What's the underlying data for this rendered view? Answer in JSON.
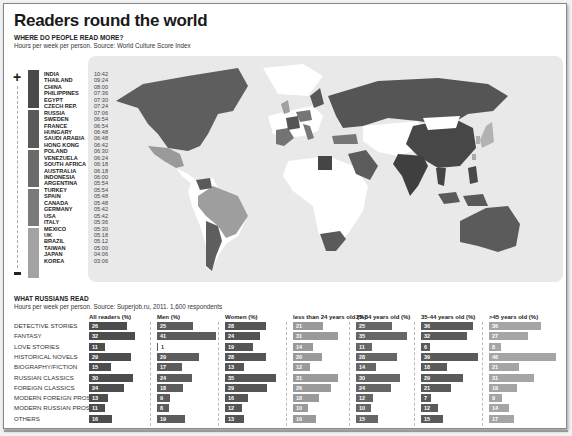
{
  "header": {
    "title": "Readers round the world",
    "map_section_title": "WHERE DO PEOPLE READ MORE?",
    "map_section_subtitle": "Hours per week per person. Source: World Culture Score Index",
    "russia_section_title": "WHAT RUSSIANS READ",
    "russia_section_subtitle": "Hours per week per person. Source: Superjob.ru, 2011. 1,600 respondents"
  },
  "legend": {
    "more_symbol": "+",
    "less_symbol": "-",
    "groups": [
      {
        "color": "#4a4a4a",
        "rows": 6
      },
      {
        "color": "#5a5a5a",
        "rows": 6
      },
      {
        "color": "#6a6a6a",
        "rows": 6
      },
      {
        "color": "#7a7a7a",
        "rows": 6
      },
      {
        "color": "#a3a3a3",
        "rows": 6
      }
    ],
    "countries": [
      {
        "name": "INDIA",
        "time": "10:42"
      },
      {
        "name": "THAILAND",
        "time": "09:24"
      },
      {
        "name": "CHINA",
        "time": "08:00"
      },
      {
        "name": "PHILIPPINES",
        "time": "07:36"
      },
      {
        "name": "EGYPT",
        "time": "07:30"
      },
      {
        "name": "CZECH REP.",
        "time": "07:24"
      },
      {
        "name": "RUSSIA",
        "time": "07:06"
      },
      {
        "name": "SWEDEN",
        "time": "06:54"
      },
      {
        "name": "FRANCE",
        "time": "06:54"
      },
      {
        "name": "HUNGARY",
        "time": "06:48"
      },
      {
        "name": "SAUDI ARABIA",
        "time": "06:48"
      },
      {
        "name": "HONG KONG",
        "time": "06:42"
      },
      {
        "name": "POLAND",
        "time": "06:30"
      },
      {
        "name": "VENEZUELA",
        "time": "06:24"
      },
      {
        "name": "SOUTH AFRICA",
        "time": "06:18"
      },
      {
        "name": "AUSTRALIA",
        "time": "06:18"
      },
      {
        "name": "INDONESIA",
        "time": "06:00"
      },
      {
        "name": "ARGENTINA",
        "time": "05:54"
      },
      {
        "name": "TURKEY",
        "time": "05:54"
      },
      {
        "name": "SPAIN",
        "time": "05:48"
      },
      {
        "name": "CANADA",
        "time": "05:48"
      },
      {
        "name": "GERMANY",
        "time": "05:42"
      },
      {
        "name": "USA",
        "time": "05:42"
      },
      {
        "name": "ITALY",
        "time": "05:36"
      },
      {
        "name": "MEXICO",
        "time": "05:30"
      },
      {
        "name": "UK",
        "time": "05:18"
      },
      {
        "name": "BRAZIL",
        "time": "05:12"
      },
      {
        "name": "TAIWAN",
        "time": "05:00"
      },
      {
        "name": "JAPAN",
        "time": "04:06"
      },
      {
        "name": "KOREA",
        "time": "03:06"
      }
    ]
  },
  "colors": {
    "all_readers": "#4d4d4d",
    "men": "#5c5c5c",
    "women": "#555555",
    "under_24": "#9a9a9a",
    "age_25_34": "#666666",
    "age_35_44": "#5a5a5a",
    "over_45": "#a5a5a5",
    "map_background": "#e9e9e9",
    "land_no_data": "#ffffff"
  },
  "chart_data": [
    {
      "type": "choropleth-map",
      "title": "WHERE DO PEOPLE READ MORE?",
      "subtitle": "Hours per week per person. Source: World Culture Score Index",
      "unit": "hours:minutes per week",
      "categories": [
        "INDIA",
        "THAILAND",
        "CHINA",
        "PHILIPPINES",
        "EGYPT",
        "CZECH REP.",
        "RUSSIA",
        "SWEDEN",
        "FRANCE",
        "HUNGARY",
        "SAUDI ARABIA",
        "HONG KONG",
        "POLAND",
        "VENEZUELA",
        "SOUTH AFRICA",
        "AUSTRALIA",
        "INDONESIA",
        "ARGENTINA",
        "TURKEY",
        "SPAIN",
        "CANADA",
        "GERMANY",
        "USA",
        "ITALY",
        "MEXICO",
        "UK",
        "BRAZIL",
        "TAIWAN",
        "JAPAN",
        "KOREA"
      ],
      "values": [
        "10:42",
        "09:24",
        "08:00",
        "07:36",
        "07:30",
        "07:24",
        "07:06",
        "06:54",
        "06:54",
        "06:48",
        "06:48",
        "06:42",
        "06:30",
        "06:24",
        "06:18",
        "06:18",
        "06:00",
        "05:54",
        "05:54",
        "05:48",
        "05:48",
        "05:42",
        "05:42",
        "05:36",
        "05:30",
        "05:18",
        "05:12",
        "05:00",
        "04:06",
        "03:06"
      ],
      "legend": {
        "top": "+",
        "bottom": "-",
        "position": "left"
      }
    },
    {
      "type": "bar",
      "orientation": "horizontal",
      "title": "WHAT RUSSIANS READ",
      "subtitle": "Hours per week per person. Source: Superjob.ru, 2011. 1,600 respondents",
      "categories": [
        "DETECTIVE STORIES",
        "FANTASY",
        "LOVE STORIES",
        "HISTORICAL NOVELS",
        "BIOGRAPHY/FICTION",
        "RUSSIAN CLASSICS",
        "FOREIGN CLASSICS",
        "MODERN FOREIGN PROSE",
        "MODERN RUSSIAN PROSE",
        "OTHERS"
      ],
      "series": [
        {
          "name": "All readers (%)",
          "values": [
            26,
            32,
            11,
            29,
            15,
            30,
            24,
            13,
            11,
            16
          ]
        },
        {
          "name": "Men (%)",
          "values": [
            25,
            41,
            1,
            29,
            17,
            24,
            18,
            9,
            8,
            19
          ]
        },
        {
          "name": "Women (%)",
          "values": [
            28,
            24,
            19,
            28,
            13,
            35,
            29,
            16,
            12,
            13
          ]
        },
        {
          "name": "less than 24 years old (%)",
          "values": [
            21,
            31,
            14,
            20,
            12,
            31,
            26,
            18,
            10,
            16
          ]
        },
        {
          "name": "25-34 years old (%)",
          "values": [
            25,
            35,
            11,
            28,
            14,
            30,
            24,
            12,
            10,
            15
          ]
        },
        {
          "name": "35-44 years old (%)",
          "values": [
            36,
            32,
            6,
            39,
            18,
            29,
            21,
            7,
            12,
            15
          ]
        },
        {
          "name": ">45 years old (%)",
          "values": [
            36,
            27,
            8,
            46,
            21,
            31,
            19,
            9,
            14,
            17
          ]
        }
      ],
      "xlabel": "",
      "ylabel": "",
      "grid": false
    }
  ]
}
